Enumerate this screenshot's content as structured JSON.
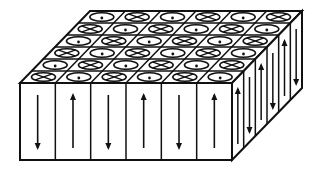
{
  "diagram": {
    "colors": {
      "stroke": "#111111",
      "fill": "#ffffff"
    },
    "geometry": {
      "front": {
        "x0": 20,
        "x1": 232,
        "y0": 83,
        "y1": 160
      },
      "depth_dx": 70,
      "depth_dy": -72
    },
    "grid": {
      "columns": 6,
      "rows": 6
    },
    "top_face_rows": [
      [
        "dot",
        "cross",
        "dot",
        "cross",
        "dot",
        "cross"
      ],
      [
        "cross",
        "dot",
        "cross",
        "dot",
        "cross",
        "dot"
      ],
      [
        "dot",
        "cross",
        "dot",
        "cross",
        "dot",
        "cross"
      ],
      [
        "cross",
        "dot",
        "cross",
        "dot",
        "cross",
        "dot"
      ],
      [
        "dot",
        "cross",
        "dot",
        "cross",
        "dot",
        "cross"
      ],
      [
        "cross",
        "dot",
        "cross",
        "dot",
        "cross",
        "dot"
      ]
    ],
    "front_face_arrows": [
      "down",
      "up",
      "down",
      "up",
      "down",
      "up"
    ],
    "side_face_arrows": [
      "up",
      "down",
      "up",
      "down",
      "up",
      "down"
    ],
    "legend": {
      "dot": "magnetization out of page (dot-in-circle)",
      "cross": "magnetization into page (cross-in-circle)"
    }
  }
}
